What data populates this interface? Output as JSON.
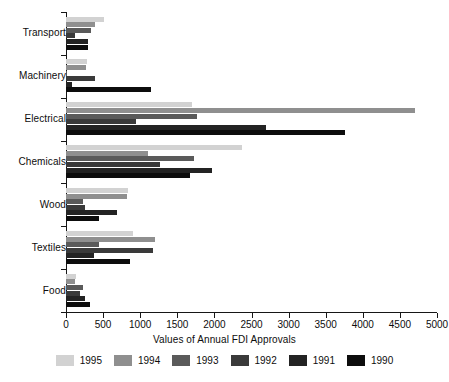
{
  "chart_data": {
    "type": "bar",
    "orientation": "horizontal",
    "title": "",
    "xlabel": "Values of Annual FDI Approvals",
    "ylabel": "",
    "xlim": [
      0,
      5000
    ],
    "xticks": [
      0,
      500,
      1000,
      1500,
      2000,
      2500,
      3000,
      3500,
      4000,
      4500,
      5000
    ],
    "xtick_labels": [
      "0",
      "500",
      "1000",
      "1500",
      "2000",
      "2500",
      "3000",
      "3500",
      "4000",
      "4500",
      "5000"
    ],
    "grid": false,
    "legend_position": "bottom",
    "categories": [
      "Transport",
      "Machinery",
      "Electrical",
      "Chemicals",
      "Wood",
      "Textiles",
      "Food"
    ],
    "series": [
      {
        "name": "1995",
        "color": "#d2d2d2",
        "values": [
          510,
          285,
          1700,
          2370,
          835,
          900,
          135
        ]
      },
      {
        "name": "1994",
        "color": "#8f8f8f",
        "values": [
          390,
          265,
          4710,
          1105,
          825,
          1200,
          115
        ]
      },
      {
        "name": "1993",
        "color": "#5a5a5a",
        "values": [
          340,
          10,
          1765,
          1725,
          230,
          445,
          225
        ]
      },
      {
        "name": "1992",
        "color": "#3a3a3a",
        "values": [
          125,
          385,
          950,
          1265,
          260,
          1170,
          190
        ]
      },
      {
        "name": "1991",
        "color": "#232323",
        "values": [
          300,
          75,
          2700,
          1970,
          690,
          375,
          260
        ]
      },
      {
        "name": "1990",
        "color": "#0d0d0d",
        "values": [
          300,
          1150,
          3760,
          1670,
          445,
          865,
          325
        ]
      }
    ]
  },
  "legend": {
    "entries": [
      {
        "label": "1995"
      },
      {
        "label": "1994"
      },
      {
        "label": "1993"
      },
      {
        "label": "1992"
      },
      {
        "label": "1991"
      },
      {
        "label": "1990"
      }
    ]
  },
  "axis": {
    "x_title": "Values of Annual FDI Approvals"
  },
  "colors": {
    "axis": "#161616",
    "text": "#0d0d0d",
    "background": "#ffffff"
  }
}
